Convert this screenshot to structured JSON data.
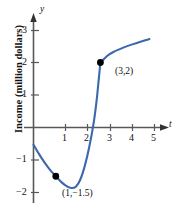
{
  "chart_data": {
    "type": "line",
    "title": "",
    "xlabel": "t",
    "ylabel": "Income (million dollars)",
    "xlim": [
      -0.25,
      5.6
    ],
    "ylim": [
      -2.35,
      3.35
    ],
    "grid": false,
    "legend": null,
    "axis_names": {
      "x": "t",
      "y": "y"
    },
    "xticks": [
      1,
      2,
      3,
      4,
      5
    ],
    "xtick_labels": [
      "1",
      "2",
      "3",
      "4",
      "5"
    ],
    "yticks": [
      3,
      2,
      1,
      -1,
      -2
    ],
    "ytick_labels": [
      "3",
      "2",
      "1",
      "−1",
      "−2"
    ],
    "series": [
      {
        "name": "income",
        "color": "#3c68ad",
        "x": [
          0.0,
          0.25,
          0.5,
          0.75,
          1.0,
          1.25,
          1.5,
          1.7,
          1.9,
          2.1,
          2.3,
          2.5,
          2.7,
          2.85,
          3.0,
          3.3,
          3.6,
          4.0,
          4.4,
          4.8,
          5.2
        ],
        "y": [
          -0.53,
          -0.82,
          -1.08,
          -1.31,
          -1.5,
          -1.68,
          -1.81,
          -1.86,
          -1.82,
          -1.6,
          -1.18,
          -0.6,
          0.15,
          0.95,
          2.0,
          2.2,
          2.33,
          2.45,
          2.55,
          2.64,
          2.72
        ]
      }
    ],
    "annotations": [
      {
        "label": "(1,−1.5)",
        "x": 1,
        "y": -1.5,
        "marker": "filled-dot"
      },
      {
        "label": "(3,2)",
        "x": 3,
        "y": 2,
        "marker": "filled-dot"
      }
    ],
    "colors": {
      "curve": "#3c68ad",
      "axis": "#58585a",
      "text": "#111111",
      "marker": "#000000",
      "background": "#ffffff"
    }
  },
  "ticks": {
    "x1": "1",
    "x2": "2",
    "x3": "3",
    "x4": "4",
    "x5": "5",
    "y3": "3",
    "y2": "2",
    "y1": "1",
    "yn1": "−1",
    "yn2": "−2"
  },
  "labels": {
    "y_axis_name": "y",
    "x_axis_name": "t",
    "y_axis_title": "Income (million dollars)",
    "point_min": "(1,−1.5)",
    "point_corner": "(3,2)"
  }
}
